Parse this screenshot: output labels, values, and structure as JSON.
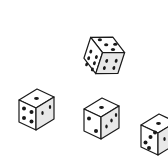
{
  "scene": {
    "title": "four-dice-illustration",
    "width": 168,
    "height": 167,
    "background_color": "#ffffff",
    "description": "Line-art illustration of four isometric cubic dice scattered on a plain white field",
    "object_count": 4
  },
  "style": {
    "outline_color": "#1a1a1a",
    "top_face_color": "#ffffff",
    "front_face_color": "#ffffff",
    "side_face_color": "#e8e8e8",
    "pip_color": "#1a1a1a",
    "stroke_width": 1.2
  },
  "dice": [
    {
      "id": "die-top",
      "label": "upper-center-die",
      "center_x": 100,
      "center_y": 54,
      "size": 26,
      "rotation_deg": 18,
      "top_face_pips": 3,
      "front_face_pips": 6,
      "side_face_pips": 2
    },
    {
      "id": "die-left",
      "label": "left-die",
      "center_x": 35,
      "center_y": 108,
      "size": 24,
      "rotation_deg": 0,
      "top_face_pips": 1,
      "front_face_pips": 4,
      "side_face_pips": 2
    },
    {
      "id": "die-center",
      "label": "lower-center-die",
      "center_x": 100,
      "center_y": 117,
      "size": 24,
      "rotation_deg": 0,
      "top_face_pips": 1,
      "front_face_pips": 2,
      "side_face_pips": 3
    },
    {
      "id": "die-right",
      "label": "right-edge-die",
      "center_x": 157,
      "center_y": 133,
      "size": 24,
      "rotation_deg": 0,
      "top_face_pips": 1,
      "front_face_pips": 3,
      "side_face_pips": 2,
      "clipped": "right edge of frame"
    }
  ]
}
